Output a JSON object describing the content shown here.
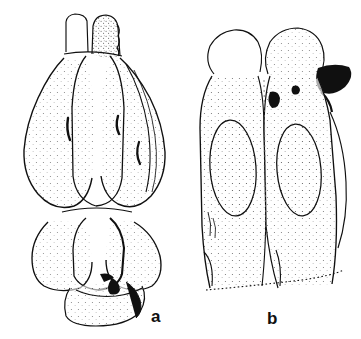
{
  "plate": {
    "domain_kind": "scientific-line-illustration",
    "technique": "stippled ink drawing",
    "background_color": "#ffffff",
    "ink_color": "#101010",
    "width": 361,
    "height": 339,
    "subject": "male genitalia, two views",
    "panel_count": 2
  },
  "labels": {
    "panel_a": "a",
    "panel_b": "b"
  },
  "panels": [
    {
      "id": "panel-a",
      "label": "a",
      "view": "ventral view",
      "label_position": {
        "x": 151,
        "y": 308
      },
      "bounds": {
        "x": 18,
        "y": 14,
        "width": 160,
        "height": 312
      },
      "features": [
        {
          "name": "apical-process-left",
          "description": "finger-like apical lobe, left"
        },
        {
          "name": "apical-process-right",
          "description": "finger-like apical lobe, right, stippled"
        },
        {
          "name": "median-lobe-left",
          "description": "bulbous rounded lateral lobe"
        },
        {
          "name": "median-lobe-right",
          "description": "bulbous rounded lateral lobe"
        },
        {
          "name": "central-lobe",
          "description": "elongate median lobe between lateral lobes"
        },
        {
          "name": "sclerite-mark-left",
          "description": "short curved dark internal sclerite"
        },
        {
          "name": "sclerite-mark-right",
          "description": "short curved dark internal sclerite"
        },
        {
          "name": "basal-lobe-left",
          "description": "lower rounded basal lobe"
        },
        {
          "name": "basal-lobe-right",
          "description": "lower rounded basal lobe"
        },
        {
          "name": "basal-piece",
          "description": "terminal basal piece with dark shading"
        }
      ]
    },
    {
      "id": "panel-b",
      "label": "b",
      "view": "lateral view",
      "label_position": {
        "x": 267,
        "y": 310
      },
      "bounds": {
        "x": 196,
        "y": 22,
        "width": 158,
        "height": 275
      },
      "features": [
        {
          "name": "apical-lobe-left",
          "description": "irregular rounded apical lobe"
        },
        {
          "name": "apical-lobe-right",
          "description": "irregular rounded apical lobe"
        },
        {
          "name": "lateral-hook",
          "description": "dark pointed lateral projection, right side"
        },
        {
          "name": "oval-depression-left",
          "description": "large oval depression, stippled margin"
        },
        {
          "name": "oval-depression-right",
          "description": "large oval depression, stippled margin"
        },
        {
          "name": "dark-pit",
          "description": "small dark pit near apex"
        },
        {
          "name": "basal-margin",
          "description": "dotted diagonal basal margin"
        }
      ]
    }
  ]
}
